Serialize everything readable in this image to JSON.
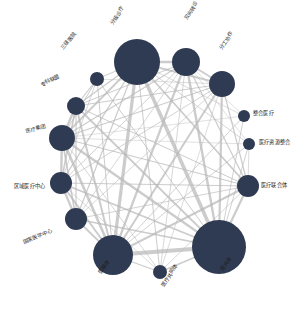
{
  "figure": {
    "type": "network-graph",
    "background_color": "#ffffff",
    "node_color": "#2f3b52",
    "edge_color": "#b9b9b9",
    "label_color": "#1c1c1c",
    "width": 307,
    "height": 321
  },
  "chart_data": {
    "type": "scatter",
    "title": "",
    "xlabel": "",
    "ylabel": "",
    "layout": "circular",
    "grid": false,
    "legend": "none",
    "node_color": "#2f3b52",
    "edge_color": "#b9b9b9",
    "nodes": [
      {
        "id": "fenji-yiliao",
        "label": "分级诊疗",
        "x": 137,
        "y": 62,
        "size": 23,
        "degree": 13,
        "label_x": 112,
        "label_y": 22,
        "rotation": -58
      },
      {
        "id": "shuangxiang-zhuanzhen",
        "label": "双向转诊",
        "x": 186,
        "y": 62,
        "size": 14,
        "degree": 12,
        "label_x": 186,
        "label_y": 17,
        "rotation": -58
      },
      {
        "id": "fengong-xiezuo",
        "label": "分工协作",
        "x": 222,
        "y": 84,
        "size": 13,
        "degree": 12,
        "label_x": 221,
        "label_y": 47,
        "rotation": -58
      },
      {
        "id": "zhenghe-yiliao",
        "label": "整合医疗",
        "x": 244,
        "y": 116,
        "size": 6,
        "degree": 6,
        "label_x": 253,
        "label_y": 111,
        "rotation": 0
      },
      {
        "id": "yiliao-ziyuan-zhenghe",
        "label": "医疗资源整合",
        "x": 249,
        "y": 144,
        "size": 6,
        "degree": 7,
        "label_x": 259,
        "label_y": 140,
        "rotation": 0
      },
      {
        "id": "yiliao-lianheti",
        "label": "医疗联合体",
        "x": 248,
        "y": 186,
        "size": 11,
        "degree": 11,
        "label_x": 261,
        "label_y": 183,
        "rotation": 0
      },
      {
        "id": "yigongti",
        "label": "医共体",
        "x": 219,
        "y": 247,
        "size": 27,
        "degree": 13,
        "label_x": 222,
        "label_y": 268,
        "rotation": -58
      },
      {
        "id": "yiliao-gongtongti",
        "label": "医疗共同体",
        "x": 160,
        "y": 272,
        "size": 7,
        "degree": 8,
        "label_x": 163,
        "label_y": 284,
        "rotation": -58
      },
      {
        "id": "yilianti",
        "label": "医联体",
        "x": 113,
        "y": 255,
        "size": 20,
        "degree": 13,
        "label_x": 100,
        "label_y": 271,
        "rotation": -58
      },
      {
        "id": "guojia-yixue-zhongxin",
        "label": "国家医学中心",
        "x": 76,
        "y": 219,
        "size": 11,
        "degree": 9,
        "label_x": 23,
        "label_y": 240,
        "rotation": -22
      },
      {
        "id": "quyu-yiliao-zhongxin",
        "label": "区域医疗中心",
        "x": 61,
        "y": 183,
        "size": 11,
        "degree": 10,
        "label_x": 14,
        "label_y": 184,
        "rotation": 0
      },
      {
        "id": "yiliao-jituan",
        "label": "医疗集团",
        "x": 62,
        "y": 138,
        "size": 13,
        "degree": 11,
        "label_x": 26,
        "label_y": 129,
        "rotation": -14
      },
      {
        "id": "zhuanke-lianmeng",
        "label": "专科联盟",
        "x": 76,
        "y": 106,
        "size": 9,
        "degree": 10,
        "label_x": 41,
        "label_y": 83,
        "rotation": -28
      },
      {
        "id": "sanji-yiyuan",
        "label": "三级医院",
        "x": 97,
        "y": 79,
        "size": 7,
        "degree": 7,
        "label_x": 62,
        "label_y": 46,
        "rotation": -50
      }
    ],
    "edges": [
      {
        "source": "fenji-yiliao",
        "target": "shuangxiang-zhuanzhen",
        "weight": 2.4
      },
      {
        "source": "fenji-yiliao",
        "target": "fengong-xiezuo",
        "weight": 2.0
      },
      {
        "source": "fenji-yiliao",
        "target": "zhenghe-yiliao",
        "weight": 0.7
      },
      {
        "source": "fenji-yiliao",
        "target": "yiliao-ziyuan-zhenghe",
        "weight": 0.8
      },
      {
        "source": "fenji-yiliao",
        "target": "yiliao-lianheti",
        "weight": 1.8
      },
      {
        "source": "fenji-yiliao",
        "target": "yigongti",
        "weight": 3.6
      },
      {
        "source": "fenji-yiliao",
        "target": "yiliao-gongtongti",
        "weight": 1.0
      },
      {
        "source": "fenji-yiliao",
        "target": "yilianti",
        "weight": 3.2
      },
      {
        "source": "fenji-yiliao",
        "target": "guojia-yixue-zhongxin",
        "weight": 1.2
      },
      {
        "source": "fenji-yiliao",
        "target": "quyu-yiliao-zhongxin",
        "weight": 1.4
      },
      {
        "source": "fenji-yiliao",
        "target": "yiliao-jituan",
        "weight": 1.8
      },
      {
        "source": "fenji-yiliao",
        "target": "zhuanke-lianmeng",
        "weight": 1.4
      },
      {
        "source": "fenji-yiliao",
        "target": "sanji-yiyuan",
        "weight": 1.0
      },
      {
        "source": "shuangxiang-zhuanzhen",
        "target": "fengong-xiezuo",
        "weight": 1.8
      },
      {
        "source": "shuangxiang-zhuanzhen",
        "target": "zhenghe-yiliao",
        "weight": 0.6
      },
      {
        "source": "shuangxiang-zhuanzhen",
        "target": "yiliao-ziyuan-zhenghe",
        "weight": 0.6
      },
      {
        "source": "shuangxiang-zhuanzhen",
        "target": "yiliao-lianheti",
        "weight": 1.2
      },
      {
        "source": "shuangxiang-zhuanzhen",
        "target": "yigongti",
        "weight": 2.4
      },
      {
        "source": "shuangxiang-zhuanzhen",
        "target": "yiliao-gongtongti",
        "weight": 0.8
      },
      {
        "source": "shuangxiang-zhuanzhen",
        "target": "yilianti",
        "weight": 2.2
      },
      {
        "source": "shuangxiang-zhuanzhen",
        "target": "guojia-yixue-zhongxin",
        "weight": 0.8
      },
      {
        "source": "shuangxiang-zhuanzhen",
        "target": "quyu-yiliao-zhongxin",
        "weight": 0.9
      },
      {
        "source": "shuangxiang-zhuanzhen",
        "target": "yiliao-jituan",
        "weight": 1.2
      },
      {
        "source": "shuangxiang-zhuanzhen",
        "target": "zhuanke-lianmeng",
        "weight": 1.0
      },
      {
        "source": "fengong-xiezuo",
        "target": "yiliao-lianheti",
        "weight": 1.2
      },
      {
        "source": "fengong-xiezuo",
        "target": "yigongti",
        "weight": 2.2
      },
      {
        "source": "fengong-xiezuo",
        "target": "yiliao-gongtongti",
        "weight": 0.7
      },
      {
        "source": "fengong-xiezuo",
        "target": "yilianti",
        "weight": 2.0
      },
      {
        "source": "fengong-xiezuo",
        "target": "guojia-yixue-zhongxin",
        "weight": 0.8
      },
      {
        "source": "fengong-xiezuo",
        "target": "quyu-yiliao-zhongxin",
        "weight": 0.9
      },
      {
        "source": "fengong-xiezuo",
        "target": "yiliao-jituan",
        "weight": 1.1
      },
      {
        "source": "fengong-xiezuo",
        "target": "zhuanke-lianmeng",
        "weight": 1.0
      },
      {
        "source": "fengong-xiezuo",
        "target": "sanji-yiyuan",
        "weight": 0.7
      },
      {
        "source": "zhenghe-yiliao",
        "target": "yigongti",
        "weight": 0.9
      },
      {
        "source": "zhenghe-yiliao",
        "target": "yilianti",
        "weight": 0.9
      },
      {
        "source": "zhenghe-yiliao",
        "target": "yiliao-jituan",
        "weight": 0.6
      },
      {
        "source": "yiliao-ziyuan-zhenghe",
        "target": "yigongti",
        "weight": 0.9
      },
      {
        "source": "yiliao-ziyuan-zhenghe",
        "target": "yilianti",
        "weight": 0.9
      },
      {
        "source": "yiliao-ziyuan-zhenghe",
        "target": "yiliao-jituan",
        "weight": 0.6
      },
      {
        "source": "yiliao-ziyuan-zhenghe",
        "target": "yiliao-lianheti",
        "weight": 0.7
      },
      {
        "source": "yiliao-lianheti",
        "target": "yigongti",
        "weight": 2.2
      },
      {
        "source": "yiliao-lianheti",
        "target": "yiliao-gongtongti",
        "weight": 0.8
      },
      {
        "source": "yiliao-lianheti",
        "target": "yilianti",
        "weight": 2.0
      },
      {
        "source": "yiliao-lianheti",
        "target": "guojia-yixue-zhongxin",
        "weight": 0.9
      },
      {
        "source": "yiliao-lianheti",
        "target": "quyu-yiliao-zhongxin",
        "weight": 1.0
      },
      {
        "source": "yiliao-lianheti",
        "target": "yiliao-jituan",
        "weight": 1.2
      },
      {
        "source": "yiliao-lianheti",
        "target": "zhuanke-lianmeng",
        "weight": 1.0
      },
      {
        "source": "yigongti",
        "target": "yiliao-gongtongti",
        "weight": 1.4
      },
      {
        "source": "yigongti",
        "target": "yilianti",
        "weight": 4.2
      },
      {
        "source": "yigongti",
        "target": "guojia-yixue-zhongxin",
        "weight": 1.6
      },
      {
        "source": "yigongti",
        "target": "quyu-yiliao-zhongxin",
        "weight": 1.8
      },
      {
        "source": "yigongti",
        "target": "yiliao-jituan",
        "weight": 2.4
      },
      {
        "source": "yigongti",
        "target": "zhuanke-lianmeng",
        "weight": 1.8
      },
      {
        "source": "yigongti",
        "target": "sanji-yiyuan",
        "weight": 1.0
      },
      {
        "source": "yiliao-gongtongti",
        "target": "yilianti",
        "weight": 1.2
      },
      {
        "source": "yiliao-gongtongti",
        "target": "yiliao-jituan",
        "weight": 0.8
      },
      {
        "source": "yiliao-gongtongti",
        "target": "quyu-yiliao-zhongxin",
        "weight": 0.7
      },
      {
        "source": "yilianti",
        "target": "guojia-yixue-zhongxin",
        "weight": 1.8
      },
      {
        "source": "yilianti",
        "target": "quyu-yiliao-zhongxin",
        "weight": 2.0
      },
      {
        "source": "yilianti",
        "target": "yiliao-jituan",
        "weight": 2.6
      },
      {
        "source": "yilianti",
        "target": "zhuanke-lianmeng",
        "weight": 2.0
      },
      {
        "source": "yilianti",
        "target": "sanji-yiyuan",
        "weight": 1.0
      },
      {
        "source": "guojia-yixue-zhongxin",
        "target": "quyu-yiliao-zhongxin",
        "weight": 2.2
      },
      {
        "source": "guojia-yixue-zhongxin",
        "target": "yiliao-jituan",
        "weight": 1.6
      },
      {
        "source": "guojia-yixue-zhongxin",
        "target": "zhuanke-lianmeng",
        "weight": 1.2
      },
      {
        "source": "quyu-yiliao-zhongxin",
        "target": "yiliao-jituan",
        "weight": 2.4
      },
      {
        "source": "quyu-yiliao-zhongxin",
        "target": "zhuanke-lianmeng",
        "weight": 1.6
      },
      {
        "source": "quyu-yiliao-zhongxin",
        "target": "sanji-yiyuan",
        "weight": 0.8
      },
      {
        "source": "yiliao-jituan",
        "target": "zhuanke-lianmeng",
        "weight": 2.4
      },
      {
        "source": "yiliao-jituan",
        "target": "sanji-yiyuan",
        "weight": 1.0
      },
      {
        "source": "zhuanke-lianmeng",
        "target": "sanji-yiyuan",
        "weight": 1.2
      }
    ]
  }
}
